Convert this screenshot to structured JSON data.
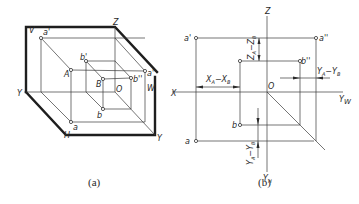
{
  "figure_a": {
    "caption": "(a)",
    "labels": {
      "V": "V",
      "Z": "Z",
      "X": "X",
      "Y_left": "Y",
      "Y_bottom": "Y",
      "H": "H",
      "W": "W",
      "O": "O",
      "a_prime": "a'",
      "a_double_prime": "a''",
      "a": "a",
      "A": "A",
      "b_prime": "b'",
      "b_double_prime": "b''",
      "b": "b",
      "B": "B"
    }
  },
  "figure_b": {
    "caption": "(b)",
    "labels": {
      "Z": "Z",
      "X": "X",
      "O": "O",
      "Y_W": "Y",
      "Y_W_sub": "W",
      "Y_H": "Y",
      "Y_H_sub": "H",
      "a_prime": "a'",
      "a_double_prime": "a''",
      "a": "a",
      "b_prime": "b'",
      "b_double_prime": "b''",
      "b": "b"
    },
    "dimensions": {
      "x_diff": "X",
      "x_diff_sub_a": "A",
      "x_diff_mid": "−X",
      "x_diff_sub_b": "B",
      "z_diff": "Z",
      "z_diff_sub_a": "A",
      "z_diff_mid": "−Z",
      "z_diff_sub_b": "B",
      "yw_diff": "Y",
      "yw_diff_sub_a": "A",
      "yw_diff_mid": "−Y",
      "yw_diff_sub_b": "B",
      "yh_diff": "Y",
      "yh_diff_sub_a": "A",
      "yh_diff_mid": "−Y",
      "yh_diff_sub_b": "B"
    }
  }
}
